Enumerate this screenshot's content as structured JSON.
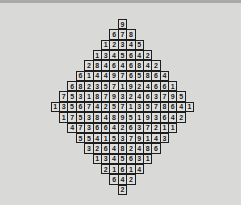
{
  "puzzle": {
    "name": "Diamond number grid",
    "colors": {
      "background": "#d9d9d7",
      "cell_fill": "#dededc",
      "cell_border": "#1e1e1e",
      "text": "#1a1a1a"
    },
    "rows": [
      [
        "9"
      ],
      [
        "6",
        "7",
        "8"
      ],
      [
        "1",
        "2",
        "3",
        "4",
        "5"
      ],
      [
        "1",
        "3",
        "4",
        "5",
        "6",
        "4",
        "2"
      ],
      [
        "2",
        "8",
        "4",
        "6",
        "4",
        "6",
        "8",
        "4",
        "2"
      ],
      [
        "6",
        "1",
        "4",
        "4",
        "9",
        "7",
        "6",
        "5",
        "8",
        "6",
        "4"
      ],
      [
        "6",
        "8",
        "2",
        "3",
        "5",
        "7",
        "1",
        "9",
        "2",
        "4",
        "6",
        "6",
        "1"
      ],
      [
        "7",
        "5",
        "3",
        "1",
        "8",
        "7",
        "9",
        "3",
        "2",
        "4",
        "6",
        "3",
        "7",
        "9",
        "5"
      ],
      [
        "1",
        "3",
        "5",
        "6",
        "7",
        "4",
        "2",
        "5",
        "7",
        "1",
        "3",
        "5",
        "7",
        "8",
        "6",
        "4",
        "1"
      ],
      [
        "1",
        "7",
        "5",
        "3",
        "8",
        "4",
        "8",
        "9",
        "5",
        "1",
        "9",
        "3",
        "6",
        "4",
        "2"
      ],
      [
        "4",
        "7",
        "3",
        "6",
        "6",
        "4",
        "2",
        "6",
        "3",
        "7",
        "2",
        "1",
        "1"
      ],
      [
        "5",
        "5",
        "4",
        "1",
        "5",
        "3",
        "7",
        "9",
        "1",
        "4",
        "3"
      ],
      [
        "3",
        "2",
        "6",
        "4",
        "8",
        "2",
        "4",
        "8",
        "6"
      ],
      [
        "1",
        "3",
        "4",
        "5",
        "6",
        "3",
        "1"
      ],
      [
        "2",
        "1",
        "6",
        "1",
        "4"
      ],
      [
        "6",
        "4",
        "2"
      ],
      [
        "2"
      ]
    ]
  }
}
